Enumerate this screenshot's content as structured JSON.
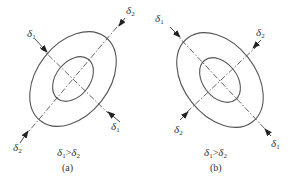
{
  "panels": [
    {
      "id": "a",
      "caption": "(a)",
      "relation": "δ1>δ2",
      "labels": {
        "d1_top": "δ",
        "d1_top_sub": "1",
        "d2_top": "δ",
        "d2_top_sub": "2",
        "d1_bottom": "δ",
        "d1_bottom_sub": "1",
        "d2_bottom": "δ",
        "d2_bottom_sub": "2"
      },
      "relation_parts": {
        "l": "δ",
        "l_sub": "1",
        "op": ">",
        "r": "δ",
        "r_sub": "2"
      }
    },
    {
      "id": "b",
      "caption": "(b)",
      "relation": "δ1>δ2",
      "labels": {
        "d1_top": "δ",
        "d1_top_sub": "1",
        "d2_top": "δ",
        "d2_top_sub": "2",
        "d1_bottom": "δ",
        "d1_bottom_sub": "1",
        "d2_bottom": "δ",
        "d2_bottom_sub": "2"
      },
      "relation_parts": {
        "l": "δ",
        "l_sub": "1",
        "op": ">",
        "r": "δ",
        "r_sub": "2"
      }
    }
  ]
}
